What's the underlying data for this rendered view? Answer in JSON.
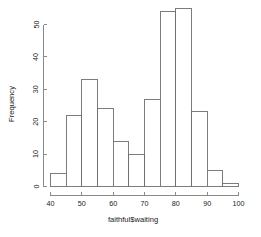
{
  "chart_data": {
    "type": "bar",
    "title": "",
    "subtitle": "",
    "xlabel": "faithful$waiting",
    "ylabel": "Frequency",
    "categories": [
      "40-45",
      "45-50",
      "50-55",
      "55-60",
      "60-65",
      "65-70",
      "70-75",
      "75-80",
      "80-85",
      "85-90",
      "90-95",
      "95-100"
    ],
    "bin_edges": [
      40,
      45,
      50,
      55,
      60,
      65,
      70,
      75,
      80,
      85,
      90,
      95,
      100
    ],
    "bin_width": 5,
    "values": [
      4,
      22,
      33,
      24,
      14,
      10,
      27,
      54,
      55,
      23,
      5,
      1
    ],
    "xlim": [
      40,
      100
    ],
    "ylim": [
      0,
      57
    ],
    "xticks": [
      40,
      50,
      60,
      70,
      80,
      90,
      100
    ],
    "xtick_labels": [
      "40",
      "50",
      "60",
      "70",
      "80",
      "90",
      "100"
    ],
    "yticks": [
      0,
      10,
      20,
      30,
      40,
      50
    ],
    "ytick_labels": [
      "0",
      "10",
      "20",
      "30",
      "40",
      "50"
    ],
    "grid": false,
    "legend": null,
    "bar_fill_color": "#ffffff",
    "bar_border_color": "#6e6e6e",
    "axis_color": "#8a8a8a",
    "background_color": "#ffffff",
    "text_color": "#1a1a1a"
  }
}
